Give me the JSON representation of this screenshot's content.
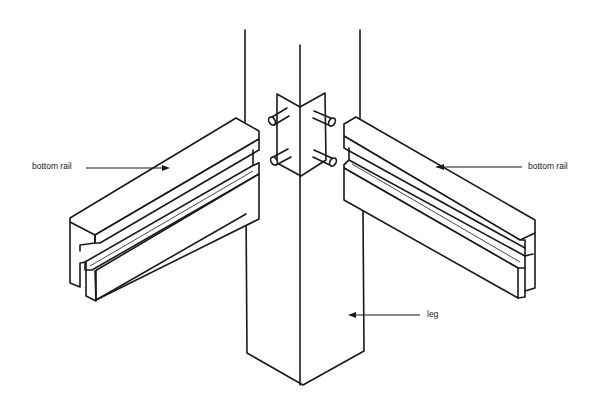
{
  "diagram": {
    "labels": {
      "left_rail": "bottom rail",
      "right_rail": "bottom rail",
      "leg": "leg"
    },
    "colors": {
      "line": "#1a1a1a",
      "background": "#ffffff"
    }
  }
}
